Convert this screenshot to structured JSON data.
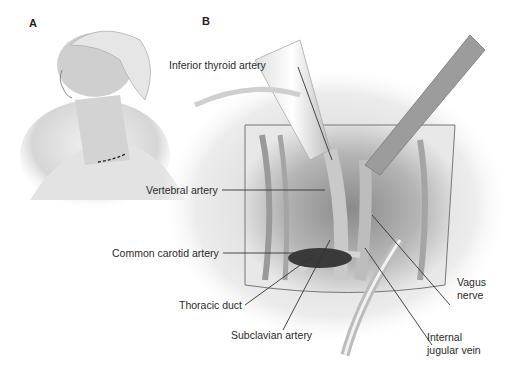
{
  "figure": {
    "panels": [
      {
        "id": "A",
        "letter": "A",
        "description": "Patient head turned with neck extended; dashed incision line above clavicle"
      },
      {
        "id": "B",
        "letter": "B",
        "description": "Operative field with retractors exposing neck vessels"
      }
    ],
    "labels": [
      {
        "id": "inferior-thyroid-artery",
        "text": "Inferior thyroid artery"
      },
      {
        "id": "vertebral-artery",
        "text": "Vertebral artery"
      },
      {
        "id": "common-carotid-artery",
        "text": "Common carotid artery"
      },
      {
        "id": "thoracic-duct",
        "text": "Thoracic duct"
      },
      {
        "id": "subclavian-artery",
        "text": "Subclavian artery"
      },
      {
        "id": "vagus-nerve-line1",
        "text": "Vagus"
      },
      {
        "id": "vagus-nerve-line2",
        "text": "nerve"
      },
      {
        "id": "internal-jugular-vein-line1",
        "text": "Internal"
      },
      {
        "id": "internal-jugular-vein-line2",
        "text": "jugular vein"
      }
    ]
  }
}
